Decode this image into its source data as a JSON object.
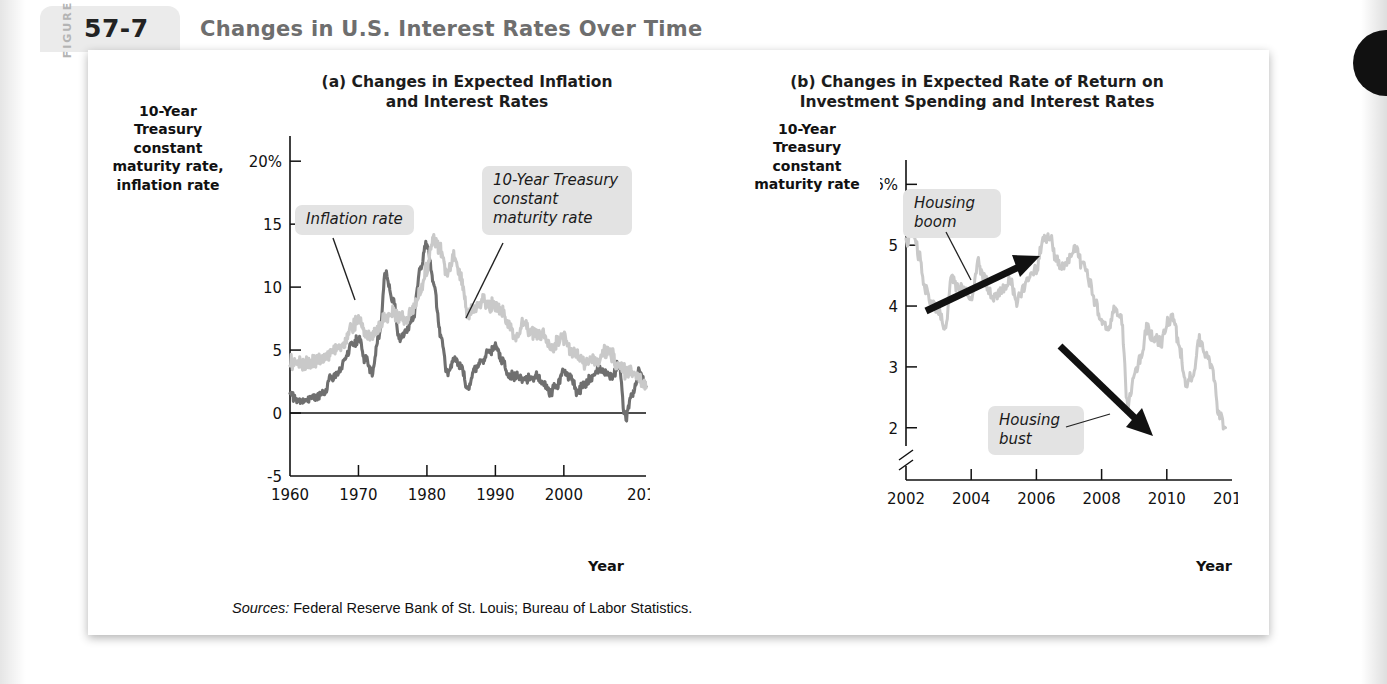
{
  "figure": {
    "word": "FIGURE",
    "number": "57-7",
    "title": "Changes in U.S. Interest Rates Over Time",
    "sources_label": "Sources:",
    "sources_text": " Federal Reserve Bank of St. Louis; Bureau of Labor Statistics."
  },
  "panel_a": {
    "title": "(a) Changes in Expected Inflation\nand Interest Rates",
    "y_axis_label": "10-Year\nTreasury\nconstant\nmaturity rate,\ninflation rate",
    "x_axis_label": "Year",
    "callout_inflation": "Inflation rate",
    "callout_treasury": "10-Year Treasury\nconstant\nmaturity rate"
  },
  "panel_b": {
    "title": "(b) Changes in Expected Rate of Return on\nInvestment Spending and Interest Rates",
    "y_axis_label": "10-Year\nTreasury\nconstant\nmaturity rate",
    "x_axis_label": "Year",
    "callout_boom": "Housing\nboom",
    "callout_bust": "Housing\nbust"
  },
  "colors": {
    "treasury_line": "#c9c9c9",
    "inflation_line": "#6f6f6f",
    "callout_bg": "#e3e3e3",
    "badge_bg": "#ebebeb",
    "title_gray": "#6e6e6e",
    "axis": "#111111"
  },
  "chart_data": [
    {
      "type": "line",
      "id": "panel-a",
      "title": "(a) Changes in Expected Inflation and Interest Rates",
      "xlabel": "Year",
      "ylabel": "10-Year Treasury constant maturity rate, inflation rate",
      "xlim": [
        1960,
        2012
      ],
      "ylim": [
        -5,
        22
      ],
      "xticks": [
        1960,
        1970,
        1980,
        1990,
        2000,
        2012
      ],
      "yticks": [
        -5,
        0,
        5,
        10,
        15,
        20
      ],
      "ytick_labels": [
        "-5",
        "0",
        "5",
        "10",
        "15",
        "20%"
      ],
      "grid": false,
      "legend": "annotations",
      "series": [
        {
          "name": "10-Year Treasury constant maturity rate",
          "color": "#c9c9c9",
          "x": [
            1960,
            1961,
            1962,
            1963,
            1964,
            1965,
            1966,
            1967,
            1968,
            1969,
            1970,
            1971,
            1972,
            1973,
            1974,
            1975,
            1976,
            1977,
            1978,
            1979,
            1980,
            1981,
            1982,
            1983,
            1984,
            1985,
            1986,
            1987,
            1988,
            1989,
            1990,
            1991,
            1992,
            1993,
            1994,
            1995,
            1996,
            1997,
            1998,
            1999,
            2000,
            2001,
            2002,
            2003,
            2004,
            2005,
            2006,
            2007,
            2008,
            2009,
            2010,
            2011,
            2012
          ],
          "values": [
            4.1,
            3.9,
            3.9,
            4.0,
            4.2,
            4.3,
            4.9,
            5.1,
            5.6,
            6.7,
            7.4,
            6.2,
            6.2,
            6.9,
            7.6,
            8.0,
            7.6,
            7.4,
            8.4,
            9.4,
            11.5,
            13.9,
            13.0,
            11.1,
            12.4,
            10.6,
            7.7,
            8.4,
            8.9,
            8.5,
            8.6,
            7.9,
            7.0,
            5.9,
            7.1,
            6.6,
            6.4,
            6.4,
            5.3,
            5.6,
            6.0,
            5.0,
            4.6,
            4.0,
            4.3,
            4.3,
            4.8,
            4.6,
            3.7,
            3.3,
            3.2,
            2.8,
            2.0
          ]
        },
        {
          "name": "Inflation rate",
          "color": "#6f6f6f",
          "x": [
            1960,
            1961,
            1962,
            1963,
            1964,
            1965,
            1966,
            1967,
            1968,
            1969,
            1970,
            1971,
            1972,
            1973,
            1974,
            1975,
            1976,
            1977,
            1978,
            1979,
            1980,
            1981,
            1982,
            1983,
            1984,
            1985,
            1986,
            1987,
            1988,
            1989,
            1990,
            1991,
            1992,
            1993,
            1994,
            1995,
            1996,
            1997,
            1998,
            1999,
            2000,
            2001,
            2002,
            2003,
            2004,
            2005,
            2006,
            2007,
            2008,
            2009,
            2010,
            2011,
            2012
          ],
          "values": [
            1.7,
            1.0,
            1.0,
            1.3,
            1.3,
            1.6,
            2.9,
            3.1,
            4.2,
            5.5,
            5.8,
            4.3,
            3.3,
            6.2,
            11.1,
            9.1,
            5.8,
            6.5,
            7.6,
            11.3,
            13.5,
            10.3,
            6.2,
            3.2,
            4.3,
            3.6,
            1.9,
            3.6,
            4.1,
            4.8,
            5.4,
            4.2,
            3.0,
            3.0,
            2.6,
            2.8,
            2.9,
            2.3,
            1.6,
            2.2,
            3.4,
            2.8,
            1.6,
            2.3,
            2.7,
            3.4,
            3.2,
            2.9,
            3.8,
            -0.4,
            1.6,
            3.2,
            2.1
          ]
        }
      ],
      "annotations": [
        {
          "text": "Inflation rate",
          "points_to_year": 1974
        },
        {
          "text": "10-Year Treasury constant maturity rate",
          "points_to_year": 1985
        }
      ]
    },
    {
      "type": "line",
      "id": "panel-b",
      "title": "(b) Changes in Expected Rate of Return on Investment Spending and Interest Rates",
      "xlabel": "Year",
      "ylabel": "10-Year Treasury constant maturity rate",
      "xlim": [
        2002,
        2012
      ],
      "ylim": [
        1.7,
        6.4
      ],
      "xticks": [
        2002,
        2004,
        2006,
        2008,
        2010,
        2012
      ],
      "yticks": [
        2,
        3,
        4,
        5,
        6
      ],
      "ytick_labels": [
        "2",
        "3",
        "4",
        "5",
        "6%"
      ],
      "axis_break": true,
      "grid": false,
      "series": [
        {
          "name": "10-Year Treasury constant maturity rate",
          "color": "#c9c9c9",
          "x": [
            2002.0,
            2002.2,
            2002.4,
            2002.6,
            2002.8,
            2003.0,
            2003.2,
            2003.4,
            2003.6,
            2003.8,
            2004.0,
            2004.2,
            2004.4,
            2004.6,
            2004.8,
            2005.0,
            2005.2,
            2005.4,
            2005.6,
            2005.8,
            2006.0,
            2006.2,
            2006.4,
            2006.6,
            2006.8,
            2007.0,
            2007.2,
            2007.4,
            2007.6,
            2007.8,
            2008.0,
            2008.2,
            2008.4,
            2008.6,
            2008.8,
            2009.0,
            2009.2,
            2009.4,
            2009.6,
            2009.8,
            2010.0,
            2010.2,
            2010.4,
            2010.6,
            2010.8,
            2011.0,
            2011.2,
            2011.4,
            2011.6,
            2011.8
          ],
          "values": [
            5.05,
            5.25,
            4.85,
            4.25,
            4.05,
            3.95,
            3.6,
            4.45,
            4.3,
            4.25,
            4.1,
            4.7,
            4.45,
            4.2,
            4.2,
            4.25,
            4.45,
            4.05,
            4.25,
            4.5,
            4.6,
            5.1,
            5.15,
            4.75,
            4.6,
            4.75,
            4.95,
            4.7,
            4.45,
            4.05,
            3.75,
            3.6,
            3.95,
            3.8,
            2.4,
            2.85,
            3.15,
            3.65,
            3.45,
            3.4,
            3.7,
            3.85,
            3.25,
            2.7,
            2.85,
            3.45,
            3.2,
            2.95,
            2.2,
            2.0
          ]
        }
      ],
      "annotations": [
        {
          "text": "Housing boom",
          "arrow": "up-right",
          "span_years": [
            2003.2,
            2006.2
          ]
        },
        {
          "text": "Housing bust",
          "arrow": "down-right",
          "span_years": [
            2007.3,
            2009.0
          ]
        }
      ]
    }
  ]
}
